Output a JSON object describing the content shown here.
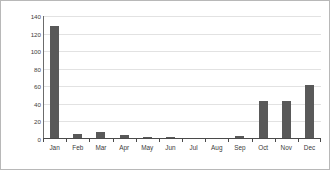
{
  "chart_data": {
    "type": "bar",
    "title": "",
    "xlabel": "",
    "ylabel": "Numbers of birds",
    "categories": [
      "Jan",
      "Feb",
      "Mar",
      "Apr",
      "May",
      "Jun",
      "Jul",
      "Aug",
      "Sep",
      "Oct",
      "Nov",
      "Dec"
    ],
    "values": [
      127,
      5,
      7,
      4,
      1,
      1,
      0,
      0,
      2,
      42,
      42,
      60
    ],
    "ylim": [
      0,
      140
    ],
    "yticks": [
      0,
      20,
      40,
      60,
      80,
      100,
      120,
      140
    ],
    "ytick_labels": [
      "0",
      "20",
      "40",
      "60",
      "80",
      "100",
      "120",
      "140"
    ],
    "grid": true,
    "legend": false,
    "bar_color": "#595959",
    "gridline_color": "#e2e2e2",
    "axis_color": "#4a4a4a",
    "background_color": "#ffffff",
    "border_color": "#b8b8b8"
  }
}
